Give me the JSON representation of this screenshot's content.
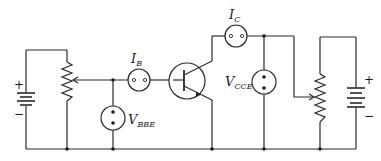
{
  "diagram": {
    "type": "circuit-schematic",
    "components": {
      "left_battery": {
        "plus": "+",
        "minus": "−"
      },
      "right_battery": {
        "plus": "+",
        "minus": "−"
      },
      "base_current_meter": {
        "symbol": "I",
        "subscript": "B"
      },
      "base_voltage_meter": {
        "symbol": "V",
        "subscript": "BBE"
      },
      "collector_current_meter": {
        "symbol": "I",
        "subscript": "C"
      },
      "collector_voltage_meter": {
        "symbol": "V",
        "subscript": "CCE"
      },
      "left_potentiometer": "variable resistor (base supply)",
      "right_potentiometer": "variable resistor (collector supply)",
      "transistor": "NPN bipolar junction transistor"
    },
    "colors": {
      "line": "#2a2a2a",
      "background": "#ffffff"
    }
  }
}
